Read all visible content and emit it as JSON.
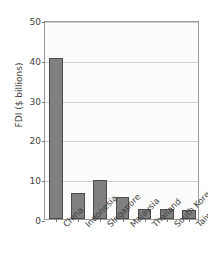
{
  "chart_data": {
    "type": "bar",
    "title": "",
    "xlabel": "",
    "ylabel": "FDI ($ billions)",
    "categories": [
      "China",
      "Indonesia",
      "Singapore",
      "Malaysia",
      "Thailand",
      "South Korea",
      "Taiwan"
    ],
    "values": [
      40.5,
      6.5,
      9.7,
      5.5,
      2.6,
      2.6,
      2.3
    ],
    "ylim": [
      0,
      50
    ],
    "yticks": [
      0,
      10,
      20,
      30,
      40,
      50
    ],
    "ytick_labels": [
      "0",
      "10",
      "20",
      "30",
      "40",
      "50"
    ],
    "grid": true,
    "legend": "none",
    "bar_color": "#808080",
    "bar_edge_color": "#4c4c4c",
    "grid_color": "#cfcfcf",
    "axis_color": "#9a9a9a",
    "plot_background": "#fcfcfc",
    "figure_background": "#ffffff",
    "text_color": "#3f3f3f"
  }
}
